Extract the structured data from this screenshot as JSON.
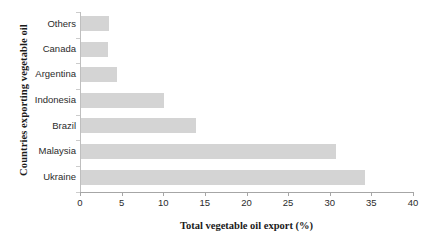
{
  "chart_data": {
    "type": "bar",
    "orientation": "horizontal",
    "title": "",
    "xlabel": "Total vegetable oil export (%)",
    "ylabel": "Countries exporting vegetable oil",
    "categories": [
      "Others",
      "Canada",
      "Argentina",
      "Indonesia",
      "Brazil",
      "Malaysia",
      "Ukraine"
    ],
    "values": [
      3.4,
      3.2,
      4.3,
      10.0,
      13.8,
      30.6,
      34.1
    ],
    "xlim": [
      0,
      40
    ],
    "xticks": [
      0,
      5,
      10,
      15,
      20,
      25,
      30,
      35,
      40
    ],
    "xtick_labels": [
      "0",
      "5",
      "10",
      "15",
      "20",
      "25",
      "30",
      "35",
      "40"
    ],
    "grid": false,
    "legend": null,
    "bar_color": "#d4d4d4",
    "axis_color": "#a6a6a6",
    "text_color": "#2b2b2b"
  }
}
